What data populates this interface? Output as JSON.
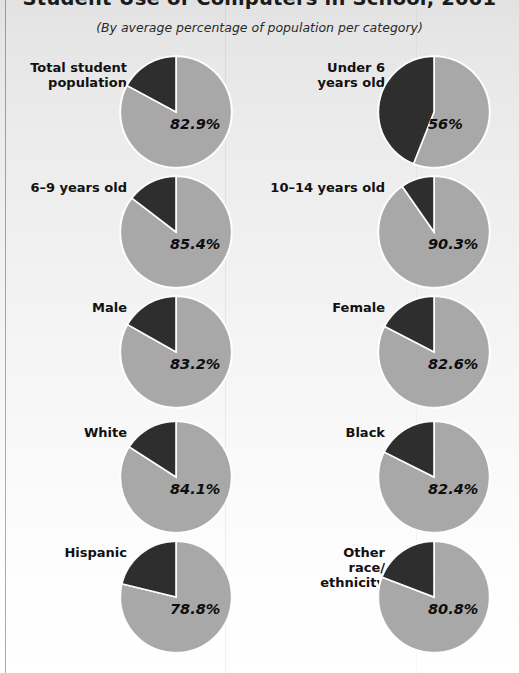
{
  "header": {
    "title": "Student Use of Computers in School, 2001",
    "subtitle": "(By average percentage of population per category)"
  },
  "colors": {
    "slice_light": "#a8a8a8",
    "slice_dark": "#2e2e2e",
    "slice_border": "#ffffff",
    "paper": "#f2f2f2",
    "text": "#111111"
  },
  "chart_data": {
    "type": "pie",
    "title": "Student Use of Computers in School, 2001",
    "subtitle": "(By average percentage of population per category)",
    "unit": "percent",
    "legend": "none",
    "grid": false,
    "series_names": [
      "Uses computers at school",
      "Does not use computers at school"
    ],
    "charts": [
      {
        "category": "Total student\npopulation",
        "label": "82.9%",
        "value": 82.9,
        "remainder": 17.1,
        "direction": "clockwise",
        "start_angle_deg": 0
      },
      {
        "category": "Under 6\nyears old",
        "label": "56%",
        "value": 56.0,
        "remainder": 44.0,
        "direction": "clockwise",
        "start_angle_deg": 0
      },
      {
        "category": "6–9 years old",
        "label": "85.4%",
        "value": 85.4,
        "remainder": 14.6,
        "direction": "clockwise",
        "start_angle_deg": 0
      },
      {
        "category": "10–14 years old",
        "label": "90.3%",
        "value": 90.3,
        "remainder": 9.7,
        "direction": "clockwise",
        "start_angle_deg": 0
      },
      {
        "category": "Male",
        "label": "83.2%",
        "value": 83.2,
        "remainder": 16.8,
        "direction": "clockwise",
        "start_angle_deg": 0
      },
      {
        "category": "Female",
        "label": "82.6%",
        "value": 82.6,
        "remainder": 17.4,
        "direction": "clockwise",
        "start_angle_deg": 0
      },
      {
        "category": "White",
        "label": "84.1%",
        "value": 84.1,
        "remainder": 15.9,
        "direction": "clockwise",
        "start_angle_deg": 0
      },
      {
        "category": "Black",
        "label": "82.4%",
        "value": 82.4,
        "remainder": 17.6,
        "direction": "clockwise",
        "start_angle_deg": 0
      },
      {
        "category": "Hispanic",
        "label": "78.8%",
        "value": 78.8,
        "remainder": 21.2,
        "direction": "clockwise",
        "start_angle_deg": 0
      },
      {
        "category": "Other\nrace/\nethnicity",
        "label": "80.8%",
        "value": 80.8,
        "remainder": 19.2,
        "direction": "clockwise",
        "start_angle_deg": 0
      }
    ]
  }
}
